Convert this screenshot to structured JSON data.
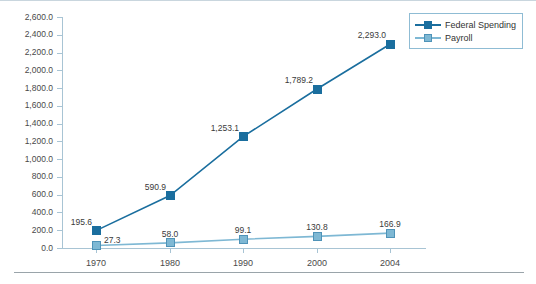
{
  "chart_data": {
    "type": "line",
    "title": "",
    "xlabel": "",
    "ylabel": "",
    "categories": [
      "1970",
      "1980",
      "1990",
      "2000",
      "2004"
    ],
    "ylim": [
      0,
      2600
    ],
    "ytick_step": 200,
    "grid": false,
    "legend_position": "top-right",
    "series": [
      {
        "name": "Federal Spending",
        "color": "#1a6e9e",
        "marker": "square-filled",
        "values": [
          195.6,
          590.9,
          1253.1,
          1789.2,
          2293.0
        ],
        "labels": [
          "195.6",
          "590.9",
          "1,253.1",
          "1,789.2",
          "2,293.0"
        ]
      },
      {
        "name": "Payroll",
        "color": "#7eb8d4",
        "marker": "square-light",
        "values": [
          27.3,
          58.0,
          99.1,
          130.8,
          166.9
        ],
        "labels": [
          "27.3",
          "58.0",
          "99.1",
          "130.8",
          "166.9"
        ]
      }
    ],
    "ytick_labels": [
      "2,600.0",
      "2,400.0",
      "2,200.0",
      "2,000.0",
      "1,800.0",
      "1,600.0",
      "1,400.0",
      "1,200.0",
      "1,000.0",
      "800.0",
      "600.0",
      "400.0",
      "200.0",
      "0.0"
    ],
    "ytick_values": [
      2600,
      2400,
      2200,
      2000,
      1800,
      1600,
      1400,
      1200,
      1000,
      800,
      600,
      400,
      200,
      0
    ]
  },
  "legend": {
    "items": [
      {
        "label": "Federal Spending"
      },
      {
        "label": "Payroll"
      }
    ]
  }
}
